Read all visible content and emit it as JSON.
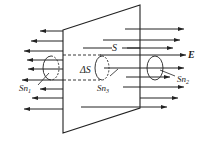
{
  "diagram": {
    "labels": {
      "surface": "S",
      "field": "E",
      "area_element": "ΔS",
      "normal_1": "Sn",
      "normal_1_sub": "1",
      "normal_2": "Sn",
      "normal_2_sub": "2",
      "normal_3": "Sn",
      "normal_3_sub": "3"
    },
    "colors": {
      "stroke": "#222222",
      "background": "#ffffff"
    },
    "field_lines": {
      "left_direction": "left",
      "right_direction": "right",
      "left_count": 9,
      "right_count": 9
    }
  }
}
